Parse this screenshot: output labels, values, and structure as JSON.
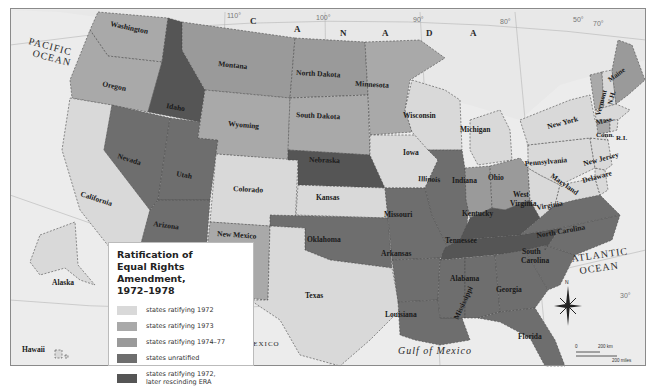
{
  "legend": {
    "title_line1": "Ratification of",
    "title_line2": "Equal Rights Amendment,",
    "title_line3": "1972–1978",
    "items": [
      {
        "label": "states ratifying 1972",
        "color": "#d9d9d9"
      },
      {
        "label": "states ratifying 1973",
        "color": "#a9a9a9"
      },
      {
        "label": "states ratifying 1974–77",
        "color": "#9a9a9a"
      },
      {
        "label": "states unratified",
        "color": "#6e6e6e"
      },
      {
        "label": "states ratifying 1972,",
        "label2": "later rescinding ERA",
        "color": "#555555"
      }
    ]
  },
  "colors": {
    "water": "#ececec",
    "foreign_land": "#e6e6e6",
    "r1972": "#d9d9d9",
    "r1973": "#a9a9a9",
    "r1974_77": "#9a9a9a",
    "unratified": "#6e6e6e",
    "rescinded": "#555555",
    "border": "#4a4a4a"
  },
  "oceans": {
    "pacific_line1": "PACIFIC",
    "pacific_line2": "OCEAN",
    "atlantic_line1": "ATLANTIC",
    "atlantic_line2": "OCEAN",
    "gulf": "Gulf of Mexico"
  },
  "countries": {
    "canada_letters": [
      "C",
      "A",
      "N",
      "A",
      "D",
      "A"
    ],
    "mexico": "MEXICO"
  },
  "longitudes": [
    "110°",
    "100°",
    "90°",
    "80°",
    "50°",
    "70°"
  ],
  "latitude_30": "30°",
  "states": {
    "washington": "Washington",
    "oregon": "Oregon",
    "california": "California",
    "idaho": "Idaho",
    "nevada": "Nevada",
    "utah": "Utah",
    "arizona": "Arizona",
    "montana": "Montana",
    "wyoming": "Wyoming",
    "colorado": "Colorado",
    "new_mexico": "New Mexico",
    "north_dakota": "North Dakota",
    "south_dakota": "South Dakota",
    "nebraska": "Nebraska",
    "kansas": "Kansas",
    "oklahoma": "Oklahoma",
    "texas": "Texas",
    "minnesota": "Minnesota",
    "iowa": "Iowa",
    "missouri": "Missouri",
    "arkansas": "Arkansas",
    "louisiana": "Louisiana",
    "wisconsin": "Wisconsin",
    "illinois": "Illinois",
    "mississippi": "Mississippi",
    "michigan": "Michigan",
    "indiana": "Indiana",
    "kentucky": "Kentucky",
    "tennessee": "Tennessee",
    "alabama": "Alabama",
    "ohio": "Ohio",
    "georgia": "Georgia",
    "florida": "Florida",
    "west_virginia_1": "West",
    "west_virginia_2": "Virginia",
    "virginia": "Virginia",
    "north_carolina": "North Carolina",
    "south_carolina_1": "South",
    "south_carolina_2": "Carolina",
    "pennsylvania": "Pennsylvania",
    "new_york": "New York",
    "maryland": "Maryland",
    "delaware": "Delaware",
    "new_jersey": "New Jersey",
    "vermont": "Vermont",
    "new_hampshire": "N.H.",
    "maine": "Maine",
    "massachusetts": "Mass.",
    "connecticut": "Conn.",
    "rhode_island": "R.I.",
    "alaska": "Alaska",
    "hawaii": "Hawaii"
  },
  "compass": {
    "north": "N"
  },
  "scale": {
    "zero": "0",
    "km": "200 km",
    "miles": "200 miles"
  }
}
